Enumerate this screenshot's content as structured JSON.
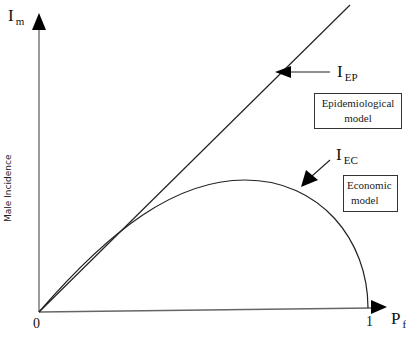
{
  "diagram": {
    "y_axis": {
      "symbol": "I",
      "subscript": "m",
      "label": "Male Incidence"
    },
    "x_axis": {
      "symbol": "P",
      "subscript": "f"
    },
    "ticks": {
      "origin": "0",
      "x_max": "1"
    },
    "curves": [
      {
        "id": "epidemiological",
        "symbol": "I",
        "subscript": "EP",
        "box_line1": "Epidemiological",
        "box_line2": "model",
        "shape": "straight line from origin"
      },
      {
        "id": "economic",
        "symbol": "I",
        "subscript": "EC",
        "box_line1": "Economic",
        "box_line2": "model",
        "shape": "hump curve from origin to (1,0)"
      }
    ]
  }
}
